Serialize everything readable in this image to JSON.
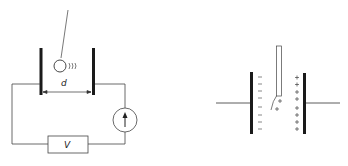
{
  "diagram": {
    "left_figure": {
      "description": "Pendulum ball oscillating between two parallel plates connected in a circuit with voltage source and current meter",
      "labels": {
        "distance": "d",
        "voltage_source": "V"
      },
      "components": [
        "left-plate",
        "right-plate",
        "pendulum-ball",
        "current-meter",
        "voltage-source"
      ]
    },
    "right_figure": {
      "description": "Strip between charged parallel plates with induced charges",
      "signs": {
        "negative": "−",
        "positive": "+"
      },
      "left_plate_charges": [
        "−",
        "−",
        "−",
        "−",
        "−",
        "−",
        "−",
        "−"
      ],
      "right_plate_charges": [
        "+",
        "+",
        "+",
        "+",
        "+",
        "+",
        "+",
        "+",
        "+"
      ],
      "strip_charges": [
        "+",
        "+"
      ]
    },
    "colors": {
      "stroke": "#222222",
      "background": "#ffffff"
    }
  }
}
